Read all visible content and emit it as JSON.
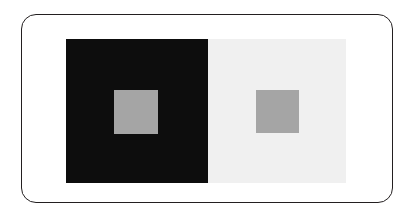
{
  "figure": {
    "name": "simultaneous-contrast-illusion",
    "caption": "",
    "background_color": "#FFFFFF"
  },
  "frame": {
    "stroke_color": "#231F20",
    "stroke_width": "1.5",
    "corner_radius": "15",
    "fill_color": "#FFFFFF"
  },
  "panels": [
    {
      "name": "dark-surround",
      "label": "",
      "color": "#0D0D0D",
      "patch": {
        "name": "gray-patch-on-dark",
        "label": "",
        "color": "#A5A5A5"
      }
    },
    {
      "name": "light-surround",
      "label": "",
      "color": "#F0F0F0",
      "patch": {
        "name": "gray-patch-on-light",
        "label": "",
        "color": "#A5A5A5"
      }
    }
  ]
}
